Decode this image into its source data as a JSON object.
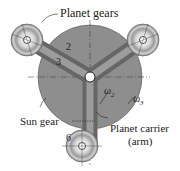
{
  "diagram": {
    "labels": {
      "planet_gears": "Planet gears",
      "sun_gear": "Sun gear",
      "planet_carrier": "Planet carrier",
      "arm": "(arm)",
      "num_2": "2",
      "num_3": "3",
      "num_6": "6",
      "omega2": "ω",
      "omega2_sub": "2",
      "omega3": "ω",
      "omega3_sub": "3"
    },
    "colors": {
      "sun_gear": "#8e8e8e",
      "arm": "#7a7a7a",
      "planet_outer": "#b5b5b5",
      "line": "#333333"
    }
  }
}
